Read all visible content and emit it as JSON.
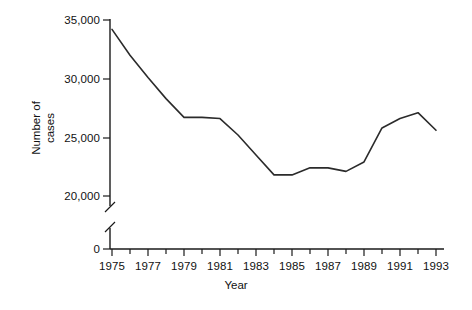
{
  "chart_data": {
    "type": "line",
    "title": "",
    "xlabel": "Year",
    "ylabel": "Number of cases",
    "x": [
      1975,
      1976,
      1977,
      1978,
      1979,
      1980,
      1981,
      1982,
      1983,
      1984,
      1985,
      1986,
      1987,
      1988,
      1989,
      1990,
      1991,
      1992,
      1993
    ],
    "values": [
      34200,
      32000,
      30100,
      28300,
      26700,
      26700,
      26600,
      25200,
      23500,
      21800,
      21800,
      22400,
      22400,
      22100,
      22900,
      25800,
      26600,
      27100,
      25600
    ],
    "series": [
      {
        "name": "Number of cases",
        "values": [
          34200,
          32000,
          30100,
          28300,
          26700,
          26700,
          26600,
          25200,
          23500,
          21800,
          21800,
          22400,
          22400,
          22100,
          22900,
          25800,
          26600,
          27100,
          25600
        ]
      }
    ],
    "ylim": [
      0,
      35000
    ],
    "xlim": [
      1975,
      1993
    ],
    "y_ticks": [
      0,
      20000,
      25000,
      30000,
      35000
    ],
    "y_tick_labels": [
      "0",
      "20,000",
      "25,000",
      "30,000",
      "35,000"
    ],
    "y_axis_break": true,
    "y_axis_break_between": [
      0,
      20000
    ],
    "x_ticks": [
      1975,
      1976,
      1977,
      1978,
      1979,
      1980,
      1981,
      1982,
      1983,
      1984,
      1985,
      1986,
      1987,
      1988,
      1989,
      1990,
      1991,
      1992,
      1993
    ],
    "x_tick_labels": [
      "1975",
      "",
      "1977",
      "",
      "1979",
      "",
      "1981",
      "",
      "1983",
      "",
      "1985",
      "",
      "1987",
      "",
      "1989",
      "",
      "1991",
      "",
      "1993"
    ],
    "x_labeled_ticks": [
      "1975",
      "1977",
      "1979",
      "1981",
      "1983",
      "1985",
      "1987",
      "1989",
      "1991",
      "1993"
    ],
    "grid": false,
    "legend": false,
    "legend_position": "none",
    "line_color": "#2b2b2b",
    "axis_color": "#1a1a1a",
    "background_color": "#ffffff"
  },
  "axis": {
    "y_title_line1": "Number of",
    "y_title_line2": "cases",
    "x_title": "Year"
  }
}
